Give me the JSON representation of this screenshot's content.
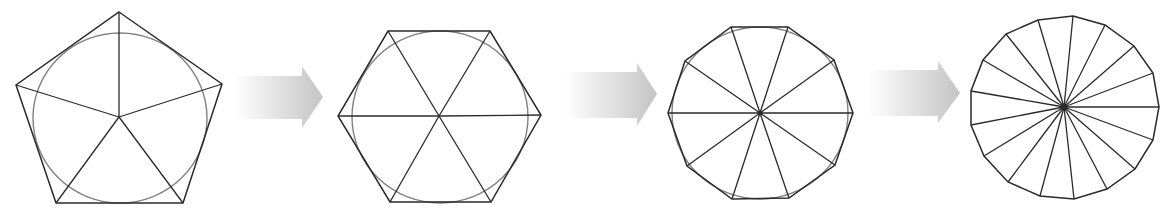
{
  "diagram": {
    "colors": {
      "background": "#ffffff",
      "polygon_stroke": "#2a2a2a",
      "circle_stroke": "#808080",
      "arrow_light": "#ffffff",
      "arrow_dark": "#c4c4c4"
    },
    "stages": [
      {
        "name": "pentagon",
        "sides": 5,
        "center": [
          119,
          117
        ],
        "vertices": [
          [
            119,
            12
          ],
          [
            222,
            84
          ],
          [
            183,
            203
          ],
          [
            56,
            203
          ],
          [
            16,
            85
          ]
        ],
        "circle": {
          "cx": 120,
          "cy": 118,
          "rx": 87,
          "ry": 85
        }
      },
      {
        "name": "hexagon",
        "sides": 6,
        "center": [
          439,
          116
        ],
        "vertices": [
          [
            388,
            31
          ],
          [
            490,
            31
          ],
          [
            541,
            115
          ],
          [
            491,
            202
          ],
          [
            390,
            202
          ],
          [
            338,
            116
          ]
        ],
        "circle": {
          "cx": 440,
          "cy": 117,
          "rx": 88,
          "ry": 86
        }
      },
      {
        "name": "decagon",
        "sides": 10,
        "center": [
          760,
          113
        ],
        "vertices": [
          [
            731,
            27
          ],
          [
            788,
            27
          ],
          [
            834,
            60
          ],
          [
            853,
            113
          ],
          [
            835,
            165
          ],
          [
            789,
            198
          ],
          [
            732,
            199
          ],
          [
            687,
            166
          ],
          [
            668,
            113
          ],
          [
            685,
            61
          ]
        ],
        "circle": {
          "cx": 760,
          "cy": 113,
          "rx": 88,
          "ry": 86
        }
      },
      {
        "name": "heptadecagon",
        "sides": 17,
        "center": [
          1064,
          107
        ],
        "vertices": [
          [
            1073,
            16
          ],
          [
            1105,
            25
          ],
          [
            1134,
            46
          ],
          [
            1153,
            73
          ],
          [
            1159,
            107
          ],
          [
            1153,
            140
          ],
          [
            1135,
            169
          ],
          [
            1107,
            189
          ],
          [
            1074,
            199
          ],
          [
            1040,
            196
          ],
          [
            1008,
            182
          ],
          [
            984,
            156
          ],
          [
            971,
            125
          ],
          [
            971,
            91
          ],
          [
            983,
            60
          ],
          [
            1006,
            34
          ],
          [
            1038,
            20
          ]
        ],
        "circle": null
      }
    ],
    "arrows": [
      {
        "name": "arrow-1",
        "body_x0": 235,
        "body_x1": 302,
        "body_y0": 76,
        "body_y1": 119,
        "head_y0": 66,
        "head_y1": 128,
        "tip": [
          323,
          97
        ]
      },
      {
        "name": "arrow-2",
        "body_x0": 565,
        "body_x1": 637,
        "body_y0": 72,
        "body_y1": 118,
        "head_y0": 63,
        "head_y1": 126,
        "tip": [
          657,
          94
        ]
      },
      {
        "name": "arrow-3",
        "body_x0": 868,
        "body_x1": 938,
        "body_y0": 70,
        "body_y1": 116,
        "head_y0": 61,
        "head_y1": 123,
        "tip": [
          960,
          93
        ]
      }
    ]
  }
}
